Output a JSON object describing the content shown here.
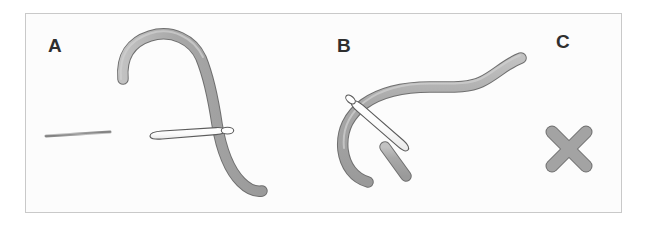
{
  "figure": {
    "caption_panels": [
      "A",
      "B",
      "C"
    ],
    "background_color": "#ffffff",
    "frame": {
      "border_color": "#c9c9c9",
      "fill_color": "#fcfcfc",
      "x": 25,
      "y": 13,
      "width": 597,
      "height": 200
    },
    "colors": {
      "tube_fill": "#a3a3a3",
      "tube_fill_light": "#b9b9b9",
      "tube_stroke": "#6f6f6f",
      "needle_fill": "#ffffff",
      "needle_stroke": "#5c5c5c",
      "label_text": "#2f2f2f",
      "x_mark_fill": "#9e9e9e",
      "x_mark_stroke": "#6f6f6f"
    },
    "panels": [
      {
        "id": "panel-a",
        "label": "A",
        "label_x": 48,
        "label_y": 52,
        "elements": [
          {
            "name": "suture-thread",
            "type": "thin-line"
          },
          {
            "name": "needle",
            "type": "needle-with-eye"
          },
          {
            "name": "curved-tube",
            "type": "arch-tube"
          }
        ]
      },
      {
        "id": "panel-b",
        "label": "B",
        "label_x": 337,
        "label_y": 52,
        "elements": [
          {
            "name": "s-curved-tube",
            "type": "s-curve-tube"
          },
          {
            "name": "tube-fragment",
            "type": "short-bar"
          },
          {
            "name": "needle",
            "type": "needle-with-eye"
          }
        ]
      },
      {
        "id": "panel-c",
        "label": "C",
        "label_x": 556,
        "label_y": 48,
        "elements": [
          {
            "name": "x-mark",
            "type": "cross"
          }
        ]
      }
    ]
  }
}
